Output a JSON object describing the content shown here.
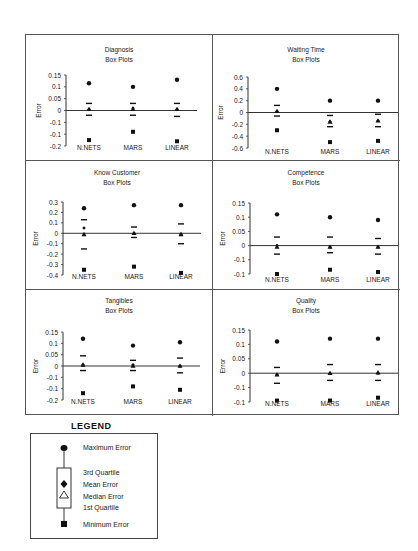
{
  "chart_data": [
    {
      "type": "box",
      "title": "Diagnosis",
      "subtitle": "Box Plots",
      "ylabel": "Error",
      "yticks": [
        "0.15",
        "0.1",
        "0.05",
        "0",
        "-0.1",
        "-0.1",
        "-0.2"
      ],
      "ylim": [
        -0.15,
        0.15
      ],
      "categories": [
        "N.NETS",
        "MARS",
        "LINEAR"
      ],
      "series": [
        {
          "name": "N.NETS",
          "max": 0.115,
          "q3": 0.03,
          "mean": 0.005,
          "median": 0.005,
          "q1": -0.02,
          "min": -0.125
        },
        {
          "name": "MARS",
          "max": 0.1,
          "q3": 0.03,
          "mean": 0.01,
          "median": 0.005,
          "q1": -0.02,
          "min": -0.09
        },
        {
          "name": "LINEAR",
          "max": 0.13,
          "q3": 0.03,
          "mean": 0.005,
          "median": 0.005,
          "q1": -0.025,
          "min": -0.13
        }
      ]
    },
    {
      "type": "box",
      "title": "Waiting Time",
      "subtitle": "Box Plots",
      "ylabel": "Error",
      "yticks": [
        "0.6",
        "0.4",
        "0.2",
        "0",
        "-0.2",
        "-0.4",
        "-0.6"
      ],
      "ylim": [
        -0.6,
        0.6
      ],
      "categories": [
        "N.NETS",
        "MARS",
        "LINEAR"
      ],
      "series": [
        {
          "name": "N.NETS",
          "max": 0.4,
          "q3": 0.12,
          "mean": 0.02,
          "median": 0.02,
          "q1": -0.06,
          "min": -0.3
        },
        {
          "name": "MARS",
          "max": 0.2,
          "q3": -0.05,
          "mean": -0.15,
          "median": -0.16,
          "q1": -0.24,
          "min": -0.5
        },
        {
          "name": "LINEAR",
          "max": 0.2,
          "q3": -0.03,
          "mean": -0.14,
          "median": -0.14,
          "q1": -0.24,
          "min": -0.48
        }
      ]
    },
    {
      "type": "box",
      "title": "Know Customer",
      "subtitle": "Box Plots",
      "ylabel": "Error",
      "yticks": [
        "0.3",
        "0.2",
        "0.1",
        "0",
        "-0.1",
        "-0.2",
        "-0.3",
        "-0.4"
      ],
      "ylim": [
        -0.4,
        0.3
      ],
      "categories": [
        "N.NETS",
        "MARS",
        "LINEAR"
      ],
      "series": [
        {
          "name": "N.NETS",
          "max": 0.24,
          "q3": 0.13,
          "mean": 0.05,
          "median": -0.01,
          "q1": -0.15,
          "min": -0.35
        },
        {
          "name": "MARS",
          "max": 0.27,
          "q3": 0.06,
          "mean": 0.0,
          "median": 0.0,
          "q1": -0.04,
          "min": -0.32
        },
        {
          "name": "LINEAR",
          "max": 0.27,
          "q3": 0.09,
          "mean": -0.01,
          "median": -0.01,
          "q1": -0.1,
          "min": -0.38
        }
      ]
    },
    {
      "type": "box",
      "title": "Competence",
      "subtitle": "Box Plots",
      "ylabel": "Error",
      "yticks": [
        "0.15",
        "0.1",
        "0.05",
        "0",
        "-0.1",
        "-0.1"
      ],
      "ylim": [
        -0.1,
        0.15
      ],
      "categories": [
        "N.NETS",
        "MARS",
        "LINEAR"
      ],
      "series": [
        {
          "name": "N.NETS",
          "max": 0.11,
          "q3": 0.03,
          "mean": 0.0,
          "median": -0.005,
          "q1": -0.03,
          "min": -0.1
        },
        {
          "name": "MARS",
          "max": 0.1,
          "q3": 0.03,
          "mean": -0.005,
          "median": -0.005,
          "q1": -0.025,
          "min": -0.085
        },
        {
          "name": "LINEAR",
          "max": 0.09,
          "q3": 0.025,
          "mean": -0.005,
          "median": -0.005,
          "q1": -0.03,
          "min": -0.093
        }
      ]
    },
    {
      "type": "box",
      "title": "Tangibles",
      "subtitle": "Box Plots",
      "ylabel": "Error",
      "yticks": [
        "0.15",
        "0.1",
        "0.05",
        "0",
        "-0.1",
        "-0.1",
        "-0.2"
      ],
      "ylim": [
        -0.15,
        0.15
      ],
      "categories": [
        "N.NETS",
        "MARS",
        "LINEAR"
      ],
      "series": [
        {
          "name": "N.NETS",
          "max": 0.12,
          "q3": 0.045,
          "mean": 0.005,
          "median": 0.005,
          "q1": -0.02,
          "min": -0.12
        },
        {
          "name": "MARS",
          "max": 0.09,
          "q3": 0.025,
          "mean": 0.005,
          "median": 0.0,
          "q1": -0.02,
          "min": -0.09
        },
        {
          "name": "LINEAR",
          "max": 0.105,
          "q3": 0.035,
          "mean": 0.0,
          "median": 0.0,
          "q1": -0.03,
          "min": -0.105
        }
      ]
    },
    {
      "type": "box",
      "title": "Quality",
      "subtitle": "Box Plots",
      "ylabel": "Error",
      "yticks": [
        "0.15",
        "0.1",
        "0.05",
        "0",
        "-0.1",
        "-0.1"
      ],
      "ylim": [
        -0.1,
        0.15
      ],
      "categories": [
        "N.NETS",
        "MARS",
        "LINEAR"
      ],
      "series": [
        {
          "name": "N.NETS",
          "max": 0.11,
          "q3": 0.02,
          "mean": -0.005,
          "median": -0.005,
          "q1": -0.035,
          "min": -0.095
        },
        {
          "name": "MARS",
          "max": 0.12,
          "q3": 0.03,
          "mean": 0.0,
          "median": 0.0,
          "q1": -0.025,
          "min": -0.095
        },
        {
          "name": "LINEAR",
          "max": 0.12,
          "q3": 0.03,
          "mean": 0.0,
          "median": 0.002,
          "q1": -0.025,
          "min": -0.085
        }
      ]
    }
  ],
  "legend": {
    "title": "LEGEND",
    "items": {
      "max": "Maximum Error",
      "q3": "3rd Quartile",
      "mean": "Mean Error",
      "median": "Median Error",
      "q1": "1st Quartile",
      "min": "Minimum Error"
    }
  }
}
